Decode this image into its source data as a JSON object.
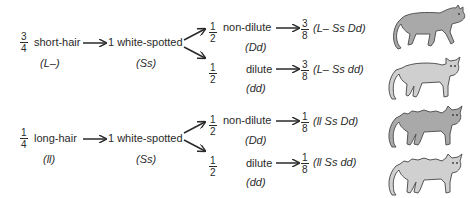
{
  "rows": [
    {
      "parent": {
        "fraction": {
          "num": "3",
          "den": "4"
        },
        "label": "short-hair",
        "genotype": "(L–)"
      },
      "middle": {
        "label": "1 white-spotted",
        "genotype": "(Ss)"
      },
      "branches": [
        {
          "fraction": {
            "num": "1",
            "den": "2"
          },
          "label": "non-dilute",
          "genotype": "(Dd)",
          "result_fraction": {
            "num": "3",
            "den": "8"
          },
          "result_genotype": "(L–  Ss  Dd)",
          "cat_icon": "dark-gray-short-hair-cat",
          "cat_color": "#a9a9a9"
        },
        {
          "fraction": {
            "num": "1",
            "den": "2"
          },
          "label": "dilute",
          "genotype": "(dd)",
          "result_fraction": {
            "num": "3",
            "den": "8"
          },
          "result_genotype": "(L–  Ss  dd)",
          "cat_icon": "light-gray-short-hair-cat",
          "cat_color": "#cfcfcf"
        }
      ]
    },
    {
      "parent": {
        "fraction": {
          "num": "1",
          "den": "4"
        },
        "label": "long-hair",
        "genotype": "(ll)"
      },
      "middle": {
        "label": "1 white-spotted",
        "genotype": "(Ss)"
      },
      "branches": [
        {
          "fraction": {
            "num": "1",
            "den": "2"
          },
          "label": "non-dilute",
          "genotype": "(Dd)",
          "result_fraction": {
            "num": "1",
            "den": "8"
          },
          "result_genotype": "(ll  Ss  Dd)",
          "cat_icon": "dark-gray-long-hair-cat",
          "cat_color": "#a9a9a9"
        },
        {
          "fraction": {
            "num": "1",
            "den": "2"
          },
          "label": "dilute",
          "genotype": "(dd)",
          "result_fraction": {
            "num": "1",
            "den": "8"
          },
          "result_genotype": "(ll  Ss  dd)",
          "cat_icon": "light-gray-long-hair-cat",
          "cat_color": "#d0d0d0"
        }
      ]
    }
  ],
  "colors": {
    "text": "#2a2a2a",
    "outline": "#555555",
    "background": "#ffffff"
  }
}
